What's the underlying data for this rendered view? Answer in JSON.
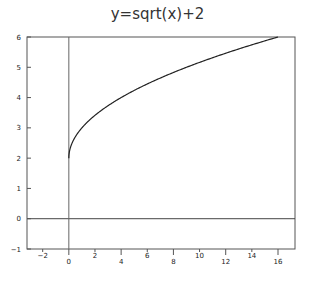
{
  "chart_data": {
    "type": "line",
    "title": "y=sqrt(x)+2",
    "xlabel": "",
    "ylabel": "",
    "xlim": [
      -3.2,
      17.3
    ],
    "ylim": [
      -1,
      6
    ],
    "grid": false,
    "legend": null,
    "x_ticks": [
      -2,
      0,
      2,
      4,
      6,
      8,
      10,
      12,
      14,
      16
    ],
    "y_ticks": [
      -1,
      0,
      1,
      2,
      3,
      4,
      5,
      6
    ],
    "reference_lines": {
      "horizontal_y": 0,
      "vertical_x": 0
    },
    "series": [
      {
        "name": "y=sqrt(x)+2",
        "x": [
          0,
          0.25,
          1,
          2,
          4,
          6,
          8,
          10,
          12,
          14,
          16
        ],
        "y": [
          2,
          2.5,
          3,
          3.41,
          4,
          4.45,
          4.83,
          5.16,
          5.46,
          5.74,
          6
        ]
      }
    ]
  }
}
